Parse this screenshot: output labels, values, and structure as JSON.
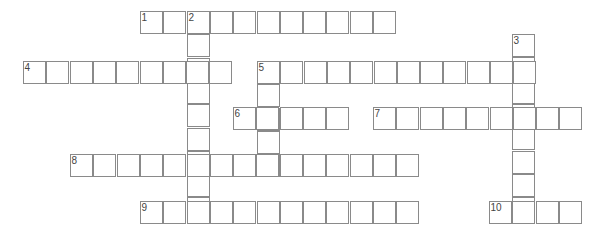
{
  "puzzle": {
    "type": "crossword",
    "cell_size": 23.3,
    "words": [
      {
        "number": "1",
        "direction": "across",
        "x": 140,
        "y": 11,
        "length": 11
      },
      {
        "number": "2",
        "direction": "down",
        "x": 187,
        "y": 11,
        "length": 9
      },
      {
        "number": "3",
        "direction": "down",
        "x": 512,
        "y": 34,
        "length": 8
      },
      {
        "number": "4",
        "direction": "across",
        "x": 23,
        "y": 61,
        "length": 9
      },
      {
        "number": "5",
        "direction": "across",
        "x": 257,
        "y": 61,
        "length": 12
      },
      {
        "number": "5",
        "direction": "down",
        "x": 257,
        "y": 61,
        "length": 5
      },
      {
        "number": "6",
        "direction": "across",
        "x": 233,
        "y": 107,
        "length": 5
      },
      {
        "number": "7",
        "direction": "across",
        "x": 373,
        "y": 107,
        "length": 9
      },
      {
        "number": "8",
        "direction": "across",
        "x": 70,
        "y": 154,
        "length": 15
      },
      {
        "number": "9",
        "direction": "across",
        "x": 140,
        "y": 201,
        "length": 12
      },
      {
        "number": "10",
        "direction": "across",
        "x": 489,
        "y": 201,
        "length": 4
      }
    ]
  }
}
